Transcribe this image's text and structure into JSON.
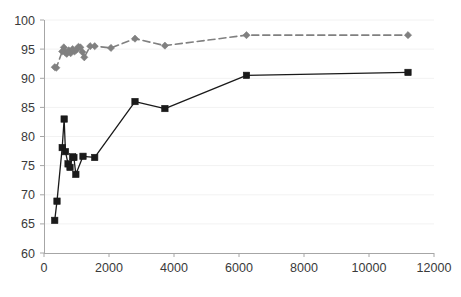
{
  "chart_data": {
    "type": "line",
    "title": "",
    "subtitle": "",
    "xlabel": "",
    "ylabel": "",
    "xlim": [
      0,
      12000
    ],
    "ylim": [
      60,
      100
    ],
    "xticks": [
      0,
      2000,
      4000,
      6000,
      8000,
      10000,
      12000
    ],
    "yticks": [
      60,
      65,
      70,
      75,
      80,
      85,
      90,
      95,
      100
    ],
    "grid": false,
    "legend": "none",
    "colors": {
      "series_gray": "#808080",
      "series_black": "#1a1a1a",
      "axis": "#a6a6a6",
      "tick_text": "#3a3a3a",
      "background": "#ffffff"
    },
    "series": [
      {
        "name": "gray-dashed-series",
        "color": "#808080",
        "marker": "diamond",
        "linestyle": "dashed",
        "points": [
          [
            330,
            91.9
          ],
          [
            380,
            91.8
          ],
          [
            560,
            94.6
          ],
          [
            610,
            95.3
          ],
          [
            660,
            94.4
          ],
          [
            700,
            94.2
          ],
          [
            760,
            94.8
          ],
          [
            820,
            94.3
          ],
          [
            880,
            95.0
          ],
          [
            940,
            94.6
          ],
          [
            1000,
            94.9
          ],
          [
            1060,
            95.4
          ],
          [
            1120,
            95.3
          ],
          [
            1180,
            94.5
          ],
          [
            1240,
            93.6
          ],
          [
            1420,
            95.5
          ],
          [
            1560,
            95.5
          ],
          [
            2060,
            95.2
          ],
          [
            2800,
            96.8
          ],
          [
            3720,
            95.6
          ],
          [
            6230,
            97.4
          ],
          [
            11200,
            97.4
          ]
        ]
      },
      {
        "name": "black-solid-series",
        "color": "#1a1a1a",
        "marker": "square",
        "linestyle": "solid",
        "points": [
          [
            330,
            65.6
          ],
          [
            400,
            68.9
          ],
          [
            560,
            78.1
          ],
          [
            620,
            83.0
          ],
          [
            660,
            77.4
          ],
          [
            740,
            75.3
          ],
          [
            800,
            74.7
          ],
          [
            880,
            76.5
          ],
          [
            920,
            76.4
          ],
          [
            980,
            73.5
          ],
          [
            1200,
            76.6
          ],
          [
            1560,
            76.4
          ],
          [
            2800,
            86.0
          ],
          [
            3720,
            84.8
          ],
          [
            6230,
            90.5
          ],
          [
            11200,
            91.0
          ]
        ]
      }
    ]
  },
  "axis": {
    "y_tick_labels": [
      "100",
      "95",
      "90",
      "85",
      "80",
      "75",
      "70",
      "65",
      "60"
    ],
    "x_tick_labels": [
      "0",
      "2000",
      "4000",
      "6000",
      "8000",
      "10000",
      "12000"
    ]
  }
}
